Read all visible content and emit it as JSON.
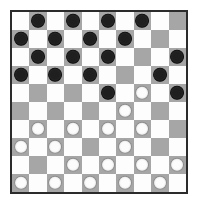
{
  "board": {
    "name": "checkers-board",
    "rows": 10,
    "cols": 10,
    "square_colors": {
      "light": "#fdfdfd",
      "dark": "#a6a6a6"
    },
    "piece_colors": {
      "black": "#1f1f1f",
      "white": "#fcfcfc",
      "white_outline": "#8c8c8c"
    },
    "border_color": "#2b2b2b",
    "background_color": "#ffffff",
    "dark_square_rule": "(row + col) odd",
    "legend": {
      "empty": ".",
      "black_piece": "b",
      "white_piece": "w"
    },
    "piece_counts": {
      "black": 21,
      "white": 22
    },
    "cells": [
      [
        ".",
        "b",
        ".",
        "b",
        ".",
        "b",
        ".",
        "b",
        ".",
        "."
      ],
      [
        "b",
        ".",
        "b",
        ".",
        "b",
        ".",
        "b",
        ".",
        ".",
        "."
      ],
      [
        ".",
        "b",
        ".",
        "b",
        ".",
        "b",
        ".",
        ".",
        ".",
        "b"
      ],
      [
        "b",
        ".",
        "b",
        ".",
        "b",
        ".",
        ".",
        ".",
        "b",
        "."
      ],
      [
        ".",
        ".",
        ".",
        ".",
        ".",
        "b",
        ".",
        "w",
        ".",
        "b"
      ],
      [
        ".",
        ".",
        ".",
        ".",
        ".",
        ".",
        "w",
        ".",
        ".",
        "."
      ],
      [
        ".",
        "w",
        ".",
        "w",
        ".",
        "w",
        ".",
        "w",
        ".",
        "."
      ],
      [
        "w",
        ".",
        "w",
        ".",
        ".",
        ".",
        "w",
        ".",
        ".",
        "."
      ],
      [
        ".",
        ".",
        ".",
        "w",
        ".",
        "w",
        ".",
        "w",
        ".",
        "w"
      ],
      [
        "w",
        ".",
        "w",
        ".",
        "w",
        ".",
        "w",
        ".",
        "w",
        "."
      ]
    ]
  }
}
